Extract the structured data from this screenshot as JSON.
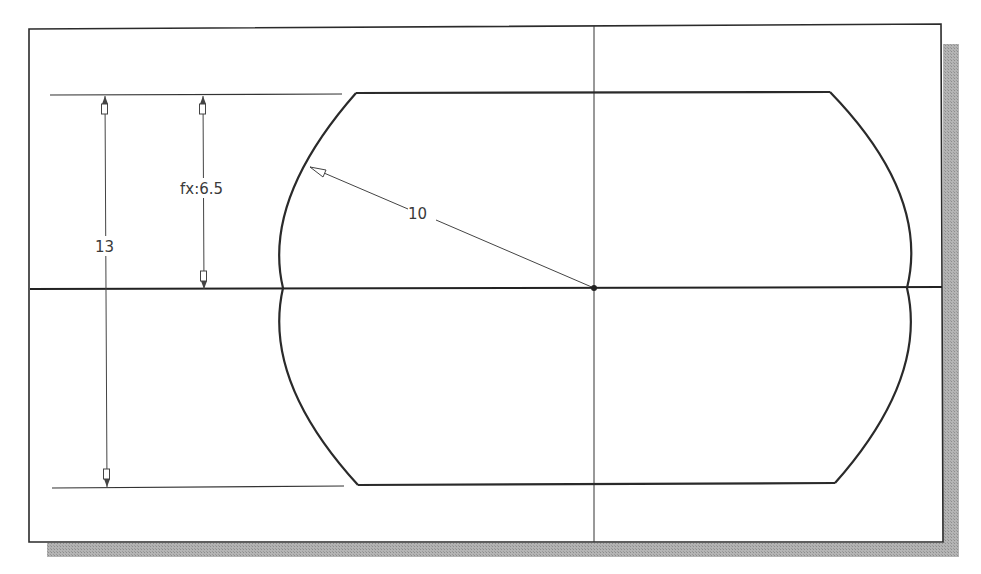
{
  "drawing": {
    "type": "2D sketch",
    "colors": {
      "background": "#ffffff",
      "frame": "#2b2b2b",
      "shadow": "#a8a8a8",
      "geometry": "#2a2a2a",
      "centerline": "#333333",
      "dimension": "#444444"
    },
    "dimensions": {
      "overall_height": {
        "label": "13"
      },
      "half_height": {
        "label": "fx:6.5"
      },
      "radius": {
        "label": "10"
      }
    }
  }
}
